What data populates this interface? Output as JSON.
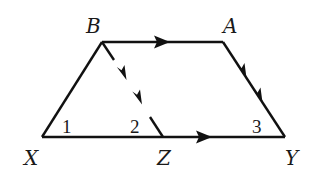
{
  "figure": {
    "type": "geometry-trapezoid",
    "stroke_color": "#111111",
    "background": "#ffffff"
  },
  "vertices": {
    "B": {
      "label": "B",
      "x": 102,
      "y": 42
    },
    "A": {
      "label": "A",
      "x": 223,
      "y": 42
    },
    "X": {
      "label": "X",
      "x": 42,
      "y": 137
    },
    "Z": {
      "label": "Z",
      "x": 163,
      "y": 137
    },
    "Y": {
      "label": "Y",
      "x": 285,
      "y": 137
    }
  },
  "angles": {
    "angle1": {
      "label": "1",
      "vertex": "X"
    },
    "angle2": {
      "label": "2",
      "vertex": "Z"
    },
    "angle3": {
      "label": "3",
      "vertex": "Y"
    }
  },
  "segments": [
    {
      "from": "X",
      "to": "B",
      "arrows": 0
    },
    {
      "from": "B",
      "to": "A",
      "arrows": 1,
      "note": "parallel to XY"
    },
    {
      "from": "A",
      "to": "Y",
      "arrows": 2,
      "note": "parallel to BZ"
    },
    {
      "from": "X",
      "to": "Y",
      "arrows": 1,
      "note": "parallel to BA"
    },
    {
      "from": "B",
      "to": "Z",
      "arrows": 2,
      "style": "broken",
      "note": "parallel to AY"
    }
  ]
}
